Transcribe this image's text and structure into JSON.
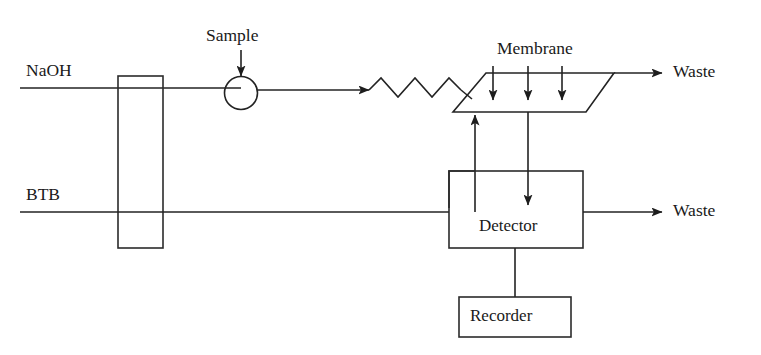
{
  "diagram": {
    "background_color": "#ffffff",
    "line_color": "#232323",
    "labels": {
      "naoh": "NaOH",
      "btb": "BTB",
      "sample": "Sample",
      "membrane": "Membrane",
      "waste_top": "Waste",
      "waste_bottom": "Waste",
      "detector": "Detector",
      "recorder": "Recorder"
    },
    "components": [
      {
        "name": "pump-block",
        "type": "rectangle",
        "label": ""
      },
      {
        "name": "sample-injection-valve",
        "type": "circle",
        "label": "Sample"
      },
      {
        "name": "reaction-coil",
        "type": "zigzag",
        "label": ""
      },
      {
        "name": "membrane-unit",
        "type": "parallelogram",
        "label": "Membrane"
      },
      {
        "name": "detector-unit",
        "type": "rectangle",
        "label": "Detector"
      },
      {
        "name": "recorder-unit",
        "type": "rectangle",
        "label": "Recorder"
      }
    ],
    "streams": [
      {
        "name": "naoh-stream",
        "label": "NaOH"
      },
      {
        "name": "btb-stream",
        "label": "BTB"
      },
      {
        "name": "waste-stream-top",
        "label": "Waste"
      },
      {
        "name": "waste-stream-bottom",
        "label": "Waste"
      }
    ]
  }
}
